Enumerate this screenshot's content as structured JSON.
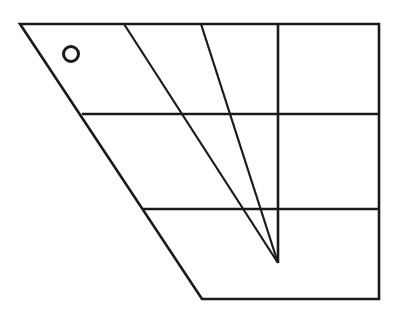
{
  "figure": {
    "canvas": {
      "width": 401,
      "height": 319,
      "background": "#ffffff"
    },
    "style": {
      "stroke_color": "#1a1a1a",
      "outline_stroke_width": 2.6,
      "inner_stroke_width": 2.2,
      "ring_stroke_width": 2.6
    },
    "vertices": {
      "top_left": {
        "x": 20,
        "y": 24
      },
      "top_right": {
        "x": 379,
        "y": 24
      },
      "bottom_right": {
        "x": 379,
        "y": 299
      },
      "bottom_left": {
        "x": 202,
        "y": 299
      }
    },
    "shapes": [
      {
        "name": "outer-outline",
        "kind": "polygon",
        "points": "20,24 379,24 379,299 202,299",
        "closed": true,
        "stroke_width": 2.6
      },
      {
        "name": "horizontal-rule-upper",
        "kind": "line",
        "x1": 82,
        "y1": 114,
        "x2": 379,
        "y2": 114,
        "stroke_width": 2.6
      },
      {
        "name": "horizontal-rule-lower",
        "kind": "line",
        "x1": 143,
        "y1": 209,
        "x2": 379,
        "y2": 209,
        "stroke_width": 2.6
      },
      {
        "name": "vertical-rule",
        "kind": "line",
        "x1": 278,
        "y1": 24,
        "x2": 278,
        "y2": 263,
        "stroke_width": 2.6
      },
      {
        "name": "diagonal-left-long",
        "kind": "line",
        "x1": 124,
        "y1": 24,
        "x2": 278,
        "y2": 263,
        "stroke_width": 2.2
      },
      {
        "name": "diagonal-right-short",
        "kind": "line",
        "x1": 201,
        "y1": 24,
        "x2": 278,
        "y2": 263,
        "stroke_width": 2.2
      },
      {
        "name": "ring-marker",
        "kind": "circle",
        "cx": 71,
        "cy": 54,
        "r": 7.5,
        "stroke_width": 3.0
      }
    ],
    "convergence_point": {
      "x": 278,
      "y": 263
    },
    "labels": []
  }
}
